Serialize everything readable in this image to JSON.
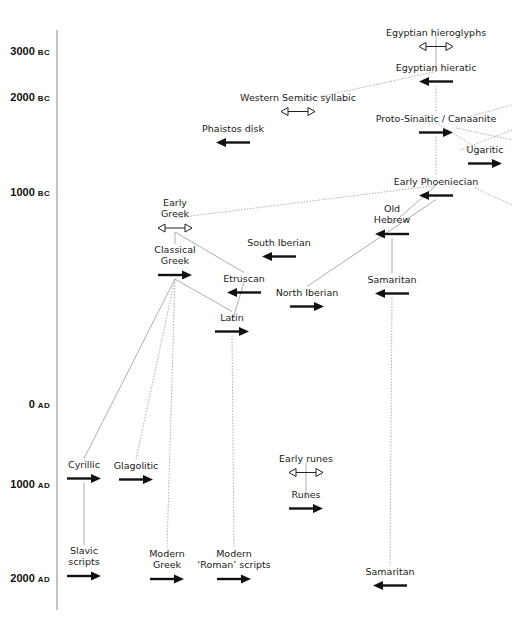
{
  "diagram": {
    "axis": {
      "ticks": [
        {
          "year": "3000",
          "era": "BC",
          "y": 52
        },
        {
          "year": "2000",
          "era": "BC",
          "y": 98
        },
        {
          "year": "1000",
          "era": "BC",
          "y": 193
        },
        {
          "year": "0",
          "era": "AD",
          "y": 405
        },
        {
          "year": "1000",
          "era": "AD",
          "y": 485
        },
        {
          "year": "2000",
          "era": "AD",
          "y": 579
        }
      ]
    },
    "legend_arrows": {
      "open_double": "undeciphered / bidirectional",
      "left": "written right-to-left",
      "right": "written left-to-right"
    },
    "nodes": [
      {
        "id": "egyptian-hieroglyphs",
        "label": "Egyptian hieroglyphs",
        "x": 436,
        "y": 38,
        "arrow": "double-open"
      },
      {
        "id": "egyptian-hieratic",
        "label": "Egyptian hieratic",
        "x": 436,
        "y": 73,
        "arrow": "left"
      },
      {
        "id": "western-semitic-syllabic",
        "label": "Western Semitic syllabic",
        "x": 298,
        "y": 103,
        "arrow": "double-open"
      },
      {
        "id": "phaistos-disk",
        "label": "Phaistos disk",
        "x": 233,
        "y": 134,
        "arrow": "left"
      },
      {
        "id": "proto-sinaitic-canaanite",
        "label": "Proto-Sinaitic / Canaanite",
        "x": 436,
        "y": 124,
        "arrow": "right"
      },
      {
        "id": "ugaritic",
        "label": "Ugaritic",
        "x": 485,
        "y": 155,
        "arrow": "right"
      },
      {
        "id": "early-phoeniecian",
        "label": "Early Phoeniecian",
        "x": 436,
        "y": 187,
        "arrow": "left"
      },
      {
        "id": "early-greek",
        "label": "Early\nGreek",
        "x": 175,
        "y": 214,
        "arrow": "double-open"
      },
      {
        "id": "old-hebrew",
        "label": "Old\nHebrew",
        "x": 392,
        "y": 220,
        "arrow": "left"
      },
      {
        "id": "south-iberian",
        "label": "South Iberian",
        "x": 279,
        "y": 248,
        "arrow": "left"
      },
      {
        "id": "classical-greek",
        "label": "Classical\nGreek",
        "x": 175,
        "y": 261,
        "arrow": "right"
      },
      {
        "id": "etruscan",
        "label": "Etruscan",
        "x": 244,
        "y": 284,
        "arrow": "left"
      },
      {
        "id": "samaritan-early",
        "label": "Samaritan",
        "x": 392,
        "y": 285,
        "arrow": "left"
      },
      {
        "id": "north-iberian",
        "label": "North Iberian",
        "x": 307,
        "y": 298,
        "arrow": "right"
      },
      {
        "id": "latin",
        "label": "Latin",
        "x": 232,
        "y": 323,
        "arrow": "right"
      },
      {
        "id": "cyrillic",
        "label": "Cyrillic",
        "x": 84,
        "y": 470,
        "arrow": "right"
      },
      {
        "id": "glagolitic",
        "label": "Glagolitic",
        "x": 136,
        "y": 471,
        "arrow": "right"
      },
      {
        "id": "early-runes",
        "label": "Early runes",
        "x": 306,
        "y": 464,
        "arrow": "double-open"
      },
      {
        "id": "runes",
        "label": "Runes",
        "x": 306,
        "y": 500,
        "arrow": "right"
      },
      {
        "id": "slavic-scripts",
        "label": "Slavic\nscripts",
        "x": 84,
        "y": 562,
        "arrow": "right"
      },
      {
        "id": "modern-greek",
        "label": "Modern\nGreek",
        "x": 167,
        "y": 565,
        "arrow": "right"
      },
      {
        "id": "modern-roman-scripts",
        "label": "Modern\n‘Roman’ scripts",
        "x": 234,
        "y": 565,
        "arrow": "right"
      },
      {
        "id": "samaritan-modern",
        "label": "Samaritan",
        "x": 390,
        "y": 577,
        "arrow": "left"
      }
    ],
    "edges": [
      {
        "from": "egyptian-hieroglyphs",
        "to": "egyptian-hieratic",
        "style": "solid"
      },
      {
        "from": "egyptian-hieratic",
        "to": "western-semitic-syllabic",
        "style": "dotted"
      },
      {
        "from": "egyptian-hieratic",
        "to": "proto-sinaitic-canaanite",
        "style": "dotted"
      },
      {
        "from": "proto-sinaitic-canaanite",
        "to": "ugaritic",
        "style": "dotted"
      },
      {
        "from": "proto-sinaitic-canaanite",
        "to": "early-phoeniecian",
        "style": "dotted"
      },
      {
        "from": "early-phoeniecian",
        "to": "early-greek",
        "style": "dotted"
      },
      {
        "from": "early-phoeniecian",
        "to": "north-iberian",
        "style": "solid"
      },
      {
        "from": "early-phoeniecian",
        "to": "old-hebrew",
        "style": "solid"
      },
      {
        "from": "early-greek",
        "to": "classical-greek",
        "style": "solid"
      },
      {
        "from": "early-greek",
        "to": "etruscan",
        "style": "solid"
      },
      {
        "from": "etruscan",
        "to": "latin",
        "style": "solid"
      },
      {
        "from": "classical-greek",
        "to": "latin",
        "style": "solid"
      },
      {
        "from": "classical-greek",
        "to": "cyrillic",
        "style": "solid"
      },
      {
        "from": "classical-greek",
        "to": "glagolitic",
        "style": "dotted"
      },
      {
        "from": "classical-greek",
        "to": "modern-greek",
        "style": "dotted"
      },
      {
        "from": "latin",
        "to": "modern-roman-scripts",
        "style": "dotted"
      },
      {
        "from": "old-hebrew",
        "to": "samaritan-early",
        "style": "solid"
      },
      {
        "from": "samaritan-early",
        "to": "samaritan-modern",
        "style": "dotted"
      },
      {
        "from": "cyrillic",
        "to": "slavic-scripts",
        "style": "solid"
      },
      {
        "from": "early-runes",
        "to": "runes",
        "style": "solid"
      }
    ]
  }
}
